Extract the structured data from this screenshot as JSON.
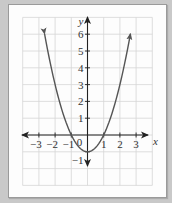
{
  "chart_data": {
    "type": "line",
    "title": "",
    "function": "y = x^2 - 1",
    "xlabel": "x",
    "ylabel": "y",
    "xlim": [
      -4,
      4
    ],
    "ylim": [
      -3,
      7
    ],
    "grid": true,
    "x_ticks": [
      -3,
      -2,
      -1,
      1,
      2,
      3
    ],
    "x_tick_labels": [
      "−3",
      "−2",
      "−1",
      "1",
      "2",
      "3"
    ],
    "y_ticks": [
      6,
      5,
      4,
      3,
      2,
      1,
      -1
    ],
    "y_tick_labels": [
      "6",
      "5",
      "4",
      "3",
      "2",
      "1",
      "−1"
    ],
    "origin_label": "0",
    "series": [
      {
        "name": "parabola",
        "x": [
          -2.65,
          -2,
          -1.5,
          -1,
          -0.5,
          0,
          0.5,
          1,
          1.5,
          2,
          2.65
        ],
        "y": [
          6.0,
          3,
          1.25,
          0,
          -0.75,
          -1,
          -0.75,
          0,
          1.25,
          3,
          6.0
        ],
        "arrows_at_ends": true
      }
    ],
    "colors": {
      "curve": "#555555",
      "axis": "#222222",
      "grid": "#d6d6d6",
      "background": "#c9c9c9",
      "card": "#fdfdfd"
    }
  }
}
